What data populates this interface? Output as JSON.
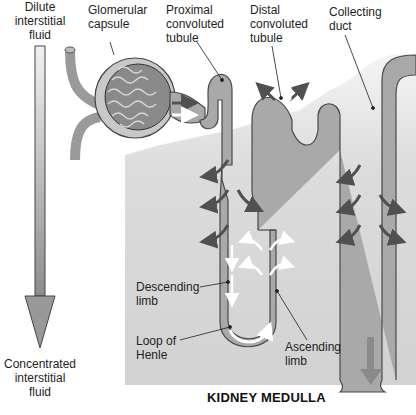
{
  "labels": {
    "dilute": "Dilute\ninterstitial\nfluid",
    "glomerular_capsule": "Glomerular\ncapsule",
    "proximal": "Proximal\nconvoluted\ntubule",
    "distal": "Distal\nconvoluted\ntubule",
    "collecting_duct": "Collecting\nduct",
    "descending": "Descending\nlimb",
    "loop": "Loop of\nHenle",
    "ascending": "Ascending\nlimb",
    "concentrated": "Concentrated\ninterstitial\nfluid",
    "region_title": "KIDNEY MEDULLA"
  },
  "colors": {
    "medulla_bg": "#d6d6d6",
    "tubule_fill": "#a9a9a9",
    "tubule_stroke": "#4a4a4a",
    "dark_arrow": "#505050",
    "white_arrow": "#ffffff",
    "gradient_arrow": "#9a9a9a"
  }
}
